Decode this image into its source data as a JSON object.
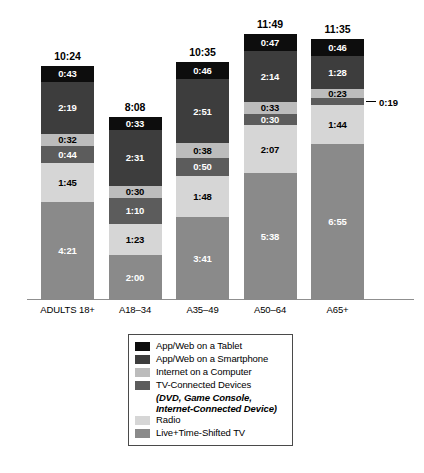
{
  "chart_data": {
    "type": "bar",
    "subtype": "stacked-bar",
    "title": "",
    "xlabel": "",
    "ylabel": "",
    "grid": false,
    "legend_position": "bottom-center",
    "value_format": "h:mm",
    "categories": [
      "ADULTS 18+",
      "A18–34",
      "A35–49",
      "A50–64",
      "A65+"
    ],
    "totals": [
      "10:24",
      "8:08",
      "10:35",
      "11:49",
      "11:35"
    ],
    "totals_minutes": [
      624,
      488,
      635,
      709,
      695
    ],
    "series": [
      {
        "name": "Live+Time-Shifted TV",
        "color": "#8a8a8a",
        "values": [
          "4:21",
          "2:00",
          "3:41",
          "5:38",
          "6:55"
        ],
        "minutes": [
          261,
          120,
          221,
          338,
          415
        ]
      },
      {
        "name": "Radio",
        "color": "#d6d6d6",
        "values": [
          "1:45",
          "1:23",
          "1:48",
          "2:07",
          "1:44"
        ],
        "minutes": [
          105,
          83,
          108,
          127,
          104
        ]
      },
      {
        "name": "TV-Connected Devices",
        "color": "#5c5c5c",
        "values": [
          "0:44",
          "1:10",
          "0:50",
          "0:30",
          "0:19"
        ],
        "minutes": [
          44,
          70,
          50,
          30,
          19
        ]
      },
      {
        "name": "Internet on a Computer",
        "color": "#bcbcbc",
        "values": [
          "0:32",
          "0:30",
          "0:38",
          "0:33",
          "0:23"
        ],
        "minutes": [
          32,
          30,
          38,
          33,
          23
        ]
      },
      {
        "name": "App/Web on a Smartphone",
        "color": "#3d3d3d",
        "values": [
          "2:19",
          "2:31",
          "2:51",
          "2:14",
          "1:28"
        ],
        "minutes": [
          139,
          151,
          171,
          134,
          88
        ]
      },
      {
        "name": "App/Web on a Tablet",
        "color": "#0d0d0d",
        "values": [
          "0:43",
          "0:33",
          "0:46",
          "0:47",
          "0:46"
        ],
        "minutes": [
          43,
          33,
          46,
          47,
          46
        ]
      }
    ],
    "callouts": [
      {
        "category": "A65+",
        "series": "TV-Connected Devices",
        "label": "0:19",
        "placement": "right-of-bar"
      }
    ]
  },
  "legend": {
    "items": [
      {
        "label": "App/Web on a Tablet",
        "color": "#0d0d0d",
        "sub": ""
      },
      {
        "label": "App/Web on a Smartphone",
        "color": "#3d3d3d",
        "sub": ""
      },
      {
        "label": "Internet on a Computer",
        "color": "#bcbcbc",
        "sub": ""
      },
      {
        "label": "TV-Connected Devices",
        "color": "#5c5c5c",
        "sub_line1": "(DVD, Game Console,",
        "sub_line2": "Internet-Connected Device)"
      },
      {
        "label": "Radio",
        "color": "#d6d6d6",
        "sub": ""
      },
      {
        "label": "Live+Time-Shifted TV",
        "color": "#8a8a8a",
        "sub": ""
      }
    ]
  },
  "source_note": ""
}
